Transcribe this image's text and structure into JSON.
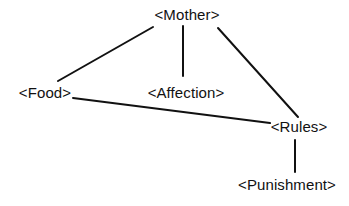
{
  "diagram": {
    "nodes": [
      {
        "id": "mother",
        "label": "<Mother>",
        "x": 187,
        "y": 15
      },
      {
        "id": "food",
        "label": "<Food>",
        "x": 45,
        "y": 93
      },
      {
        "id": "affection",
        "label": "<Affection>",
        "x": 186,
        "y": 93
      },
      {
        "id": "rules",
        "label": "<Rules>",
        "x": 299,
        "y": 127
      },
      {
        "id": "punishment",
        "label": "<Punishment>",
        "x": 287,
        "y": 185
      }
    ],
    "edges": [
      {
        "from": "mother",
        "to": "food",
        "x1": 153,
        "y1": 27,
        "x2": 58,
        "y2": 81
      },
      {
        "from": "mother",
        "to": "affection",
        "x1": 183,
        "y1": 26,
        "x2": 183,
        "y2": 76
      },
      {
        "from": "mother",
        "to": "rules",
        "x1": 218,
        "y1": 28,
        "x2": 298,
        "y2": 117
      },
      {
        "from": "food",
        "to": "rules",
        "x1": 73,
        "y1": 98,
        "x2": 270,
        "y2": 123
      },
      {
        "from": "rules",
        "to": "punishment",
        "x1": 295,
        "y1": 140,
        "x2": 295,
        "y2": 172
      }
    ],
    "colors": {
      "line": "#111111",
      "text": "#111111",
      "background": "#ffffff"
    }
  }
}
